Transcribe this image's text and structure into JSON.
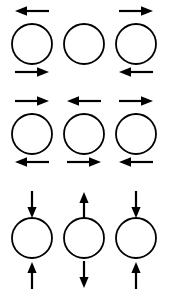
{
  "figure": {
    "title": "",
    "background_color": "#ffffff",
    "stroke_color": "#000000",
    "circle_diameter_px": 40,
    "columns": 3,
    "rows": 3
  },
  "legend": {
    "arrow_left_label": "left-arrow",
    "arrow_right_label": "right-arrow",
    "arrow_up_label": "up-arrow",
    "arrow_down_label": "down-arrow",
    "circle_label": "circle"
  },
  "grid": [
    {
      "row_index": 0,
      "orientation": "horizontal",
      "cells": [
        {
          "col_index": 0,
          "circle": "circle",
          "top_arrow": "left",
          "bottom_arrow": "right"
        },
        {
          "col_index": 1,
          "circle": "circle",
          "top_arrow": "none",
          "bottom_arrow": "none"
        },
        {
          "col_index": 2,
          "circle": "circle",
          "top_arrow": "right",
          "bottom_arrow": "left"
        }
      ]
    },
    {
      "row_index": 1,
      "orientation": "horizontal",
      "cells": [
        {
          "col_index": 0,
          "circle": "circle",
          "top_arrow": "right",
          "bottom_arrow": "left"
        },
        {
          "col_index": 1,
          "circle": "circle",
          "top_arrow": "left",
          "bottom_arrow": "right"
        },
        {
          "col_index": 2,
          "circle": "circle",
          "top_arrow": "right",
          "bottom_arrow": "left"
        }
      ]
    },
    {
      "row_index": 2,
      "orientation": "vertical",
      "cells": [
        {
          "col_index": 0,
          "circle": "circle",
          "top_arrow": "down",
          "bottom_arrow": "up"
        },
        {
          "col_index": 1,
          "circle": "circle",
          "top_arrow": "up",
          "bottom_arrow": "down"
        },
        {
          "col_index": 2,
          "circle": "circle",
          "top_arrow": "down",
          "bottom_arrow": "up"
        }
      ]
    }
  ]
}
